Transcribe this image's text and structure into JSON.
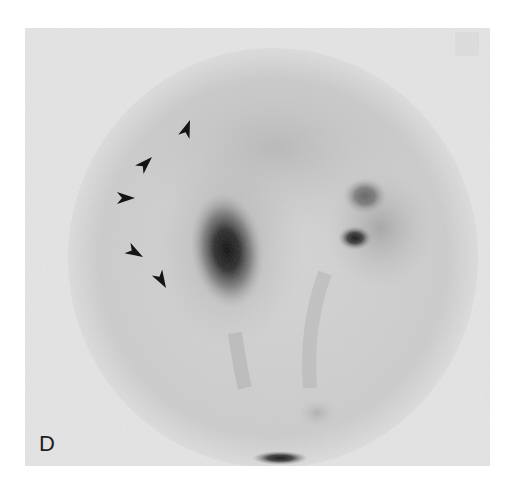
{
  "figure": {
    "panel_label": "D",
    "image_type": "grayscale nuclear scintigraphy (circular gamma-camera field of view)",
    "colors": {
      "frame_background": "#e6e6e6",
      "field_of_view": "#d2d2d2",
      "hot_spot": "#101010",
      "arrowhead": "#141414",
      "page_background": "#ffffff"
    },
    "arrowheads": [
      {
        "id": "arrow-1",
        "x": 190,
        "y": 120,
        "rotation": 200
      },
      {
        "id": "arrow-2",
        "x": 145,
        "y": 150,
        "rotation": 225
      },
      {
        "id": "arrow-3",
        "x": 126,
        "y": 196,
        "rotation": 265
      },
      {
        "id": "arrow-4",
        "x": 133,
        "y": 258,
        "rotation": 300
      },
      {
        "id": "arrow-5",
        "x": 161,
        "y": 293,
        "rotation": 330
      }
    ],
    "annotation_count": 5
  }
}
